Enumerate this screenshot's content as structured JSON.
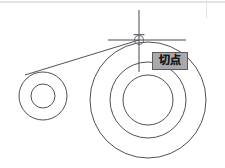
{
  "app": {
    "kind": "cad-drawing-canvas",
    "background_color": "#ffffff",
    "geometry_stroke_color": "#3d3d46",
    "crosshair_color": "#4a4a52",
    "frame_line_color": "#d9d9d9"
  },
  "tooltip": {
    "label": "切点",
    "meaning_label": "切点",
    "background_color": "#a9a9a9",
    "border_color": "#5c5c5c",
    "text_color": "#1a1a1a",
    "x": 152,
    "y": 52,
    "width": 36,
    "height": 18
  },
  "cursor": {
    "name": "crosshair-cursor",
    "x": 139,
    "y": 40,
    "vertical_line": {
      "x": 139,
      "y1": 10,
      "y2": 72
    },
    "horizontal_line": {
      "y": 40,
      "x1": 108,
      "x2": 186
    },
    "snap_marker": {
      "type": "tangent-snap-marker",
      "shape": "circle-with-top-tangent-line",
      "cx": 139,
      "cy": 40,
      "r": 4.5
    }
  },
  "geometry": {
    "circles": [
      {
        "name": "left-outer-circle",
        "cx": 43,
        "cy": 96,
        "r": 24
      },
      {
        "name": "left-inner-circle",
        "cx": 43,
        "cy": 96,
        "r": 12
      },
      {
        "name": "right-outer-circle",
        "cx": 148,
        "cy": 100,
        "r": 58
      },
      {
        "name": "right-middle-circle",
        "cx": 148,
        "cy": 100,
        "r": 38
      },
      {
        "name": "right-inner-circle",
        "cx": 148,
        "cy": 100,
        "r": 25
      }
    ],
    "tangent_line": {
      "name": "tangent-line",
      "x1": 25,
      "y1": 75,
      "x2": 139,
      "y2": 40
    }
  },
  "frame": {
    "top_rule": {
      "x1": 0,
      "y1": 2,
      "x2": 225,
      "y2": 2
    },
    "right_rule": {
      "x1": 206,
      "y1": 0,
      "x2": 206,
      "y2": 18
    }
  }
}
